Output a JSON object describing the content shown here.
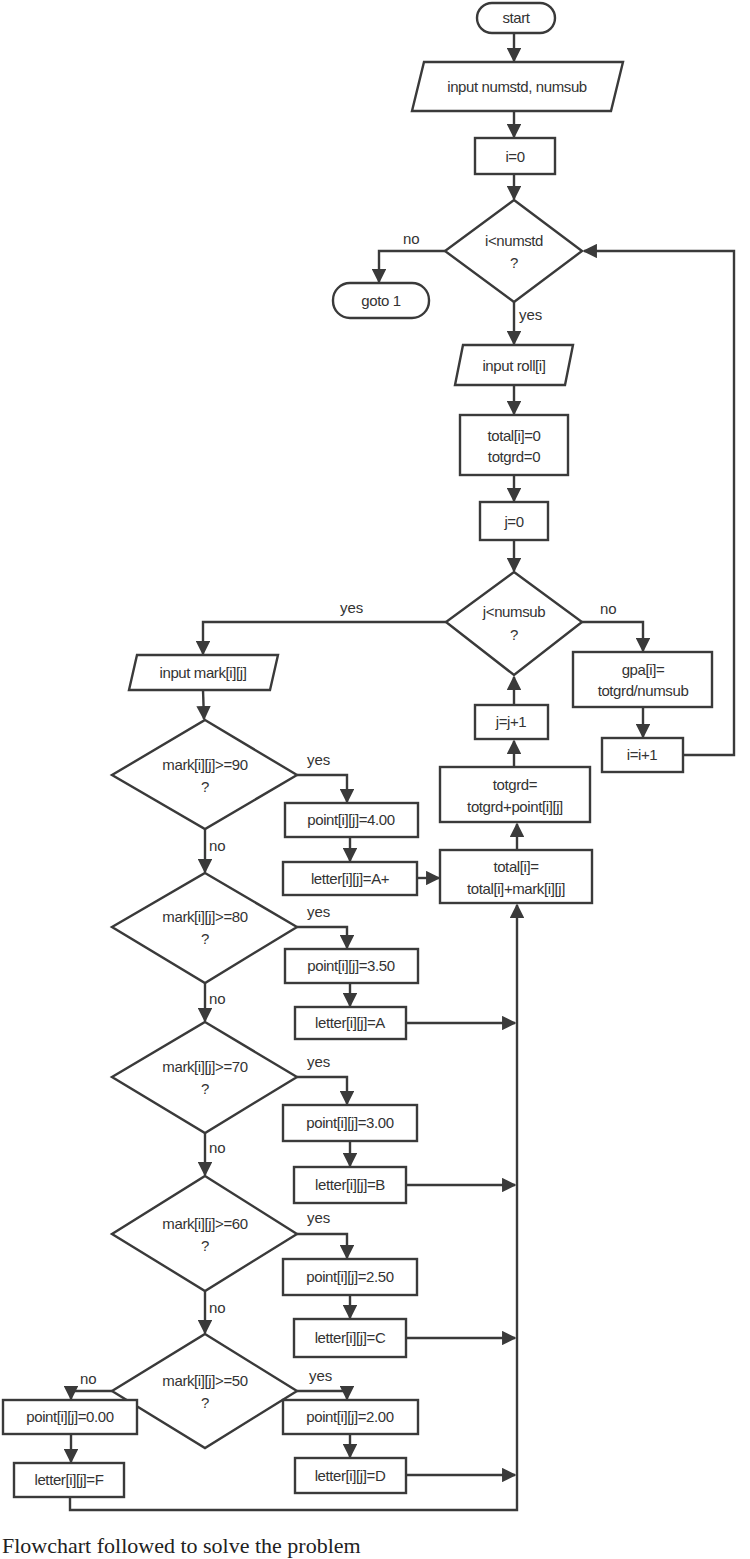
{
  "diagram": {
    "type": "flowchart",
    "nodes": {
      "start": "start",
      "input_counts": "input numstd, numsub",
      "init_i": "i=0",
      "cond_i_line1": "i<numstd",
      "cond_i_line2": "?",
      "goto1": "goto 1",
      "input_roll": "input roll[i]",
      "init_totals_line1": "total[i]=0",
      "init_totals_line2": "totgrd=0",
      "init_j": "j=0",
      "cond_j_line1": "j<numsub",
      "cond_j_line2": "?",
      "gpa_line1": "gpa[i]=",
      "gpa_line2": "totgrd/numsub",
      "inc_i": "i=i+1",
      "inc_j": "j=j+1",
      "totgrd_line1": "totgrd=",
      "totgrd_line2": "totgrd+point[i][j]",
      "total_line1": "total[i]=",
      "total_line2": "total[i]+mark[i][j]",
      "input_mark": "input mark[i][j]"
    },
    "grade_checks": [
      {
        "cond": "mark[i][j]>=90",
        "q": "?",
        "point": "point[i][j]=4.00",
        "letter": "letter[i][j]=A+"
      },
      {
        "cond": "mark[i][j]>=80",
        "q": "?",
        "point": "point[i][j]=3.50",
        "letter": "letter[i][j]=A"
      },
      {
        "cond": "mark[i][j]>=70",
        "q": "?",
        "point": "point[i][j]=3.00",
        "letter": "letter[i][j]=B"
      },
      {
        "cond": "mark[i][j]>=60",
        "q": "?",
        "point": "point[i][j]=2.50",
        "letter": "letter[i][j]=C"
      },
      {
        "cond": "mark[i][j]>=50",
        "q": "?",
        "point": "point[i][j]=2.00",
        "letter": "letter[i][j]=D"
      }
    ],
    "fail_branch": {
      "point": "point[i][j]=0.00",
      "letter": "letter[i][j]=F"
    },
    "edge_labels": {
      "yes": "yes",
      "no": "no"
    }
  },
  "caption": "Flowchart followed to solve the problem"
}
